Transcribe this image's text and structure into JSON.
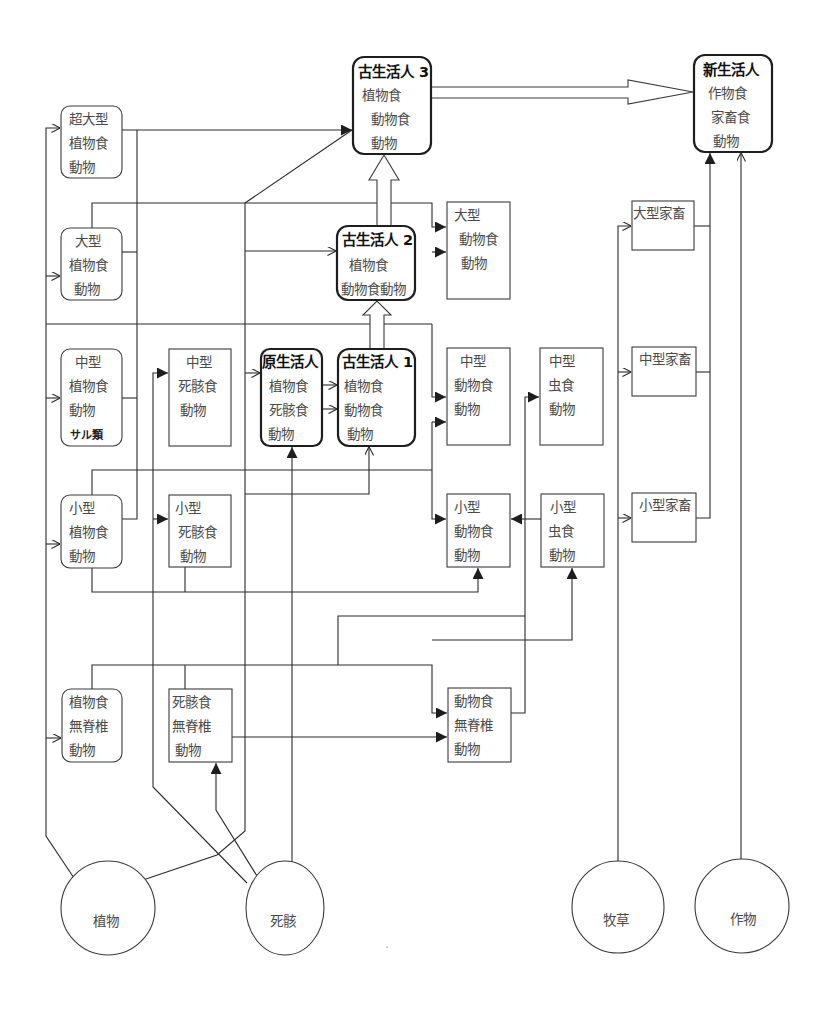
{
  "diagram": {
    "type": "food-web-flow-diagram",
    "nodes": {
      "super_large_herbivore": {
        "lines": [
          "超大型",
          "植物食",
          "動物"
        ]
      },
      "large_herbivore": {
        "lines": [
          "大型",
          "植物食",
          "動物"
        ]
      },
      "medium_herbivore": {
        "lines": [
          "中型",
          "植物食",
          "動物",
          "サル類"
        ]
      },
      "small_herbivore": {
        "lines": [
          "小型",
          "植物食",
          "動物"
        ]
      },
      "herbivore_invertebrate": {
        "lines": [
          "植物食",
          "無脊椎",
          "動物"
        ]
      },
      "medium_scavenger": {
        "lines": [
          "中型",
          "死骸食",
          "動物"
        ]
      },
      "small_scavenger": {
        "lines": [
          "小型",
          "死骸食",
          "動物"
        ]
      },
      "scavenger_invertebrate": {
        "lines": [
          "死骸食",
          "無脊椎",
          "動物"
        ]
      },
      "proto_human": {
        "title": "原生活人",
        "lines": [
          "植物食",
          "死骸食",
          "動物"
        ]
      },
      "paleo_human_1": {
        "title": "古生活人 1",
        "lines": [
          "植物食",
          "動物食",
          "動物"
        ]
      },
      "paleo_human_2": {
        "title": "古生活人 2",
        "lines": [
          "植物食",
          "動物食動物"
        ]
      },
      "paleo_human_3": {
        "title": "古生活人 3",
        "lines": [
          "植物食",
          "動物食",
          "動物"
        ]
      },
      "neo_human": {
        "title": "新生活人",
        "lines": [
          "作物食",
          "家畜食",
          "動物"
        ]
      },
      "large_carnivore": {
        "lines": [
          "大型",
          "動物食",
          "動物"
        ]
      },
      "medium_carnivore": {
        "lines": [
          "中型",
          "動物食",
          "動物"
        ]
      },
      "small_carnivore": {
        "lines": [
          "小型",
          "動物食",
          "動物"
        ]
      },
      "carnivore_invertebrate": {
        "lines": [
          "動物食",
          "無脊椎",
          "動物"
        ]
      },
      "medium_insectivore": {
        "lines": [
          "中型",
          "虫食",
          "動物"
        ]
      },
      "small_insectivore": {
        "lines": [
          "小型",
          "虫食",
          "動物"
        ]
      },
      "large_livestock": {
        "lines": [
          "大型家畜"
        ]
      },
      "medium_livestock": {
        "lines": [
          "中型家畜"
        ]
      },
      "small_livestock": {
        "lines": [
          "小型家畜"
        ]
      },
      "plants": {
        "label": "植物"
      },
      "carcass": {
        "label": "死骸"
      },
      "pasture": {
        "label": "牧草"
      },
      "crops": {
        "label": "作物"
      }
    }
  }
}
